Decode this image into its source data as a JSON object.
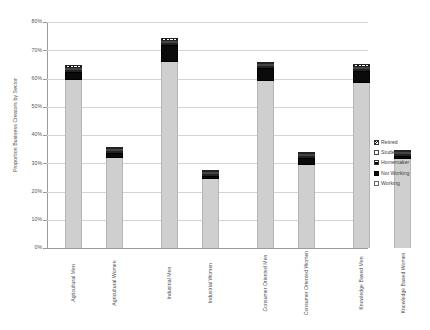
{
  "chart_data": {
    "type": "bar",
    "title": "",
    "subtitle": "",
    "xlabel": "",
    "ylabel": "Proportion Business Creators by Sector",
    "ylim": [
      0,
      80
    ],
    "ytick_labels": [
      "80%",
      "70%",
      "60%",
      "50%",
      "40%",
      "30%",
      "20%",
      "10%",
      "0%"
    ],
    "ytick_values": [
      80,
      70,
      60,
      50,
      40,
      30,
      20,
      10,
      0
    ],
    "grid": true,
    "legend_position": "right",
    "stacked": true,
    "categories": [
      "Agricultural Men",
      "Agricultural Women",
      "Industrial Men",
      "Industrial Women",
      "Consumer Oriented Men",
      "Consumer Oriented Women",
      "Knowledge Based Men",
      "Knowledge Based Women"
    ],
    "series": [
      {
        "name": "Working",
        "swatch": "white-outline",
        "values": [
          59.5,
          32.0,
          66.0,
          24.5,
          59.0,
          29.5,
          58.5,
          31.5
        ]
      },
      {
        "name": "Not Working",
        "swatch": "black-solid",
        "values": [
          2.8,
          1.6,
          6.0,
          0.9,
          4.6,
          2.2,
          4.0,
          0.9
        ]
      },
      {
        "name": "Homemaker",
        "swatch": "horizontal-hatch",
        "values": [
          0.6,
          0.7,
          0.5,
          0.3,
          0.6,
          0.7,
          0.5,
          0.5
        ]
      },
      {
        "name": "Student",
        "swatch": "white-box",
        "values": [
          0.5,
          0.6,
          0.4,
          0.3,
          0.5,
          0.6,
          0.4,
          0.4
        ]
      },
      {
        "name": "Retired",
        "swatch": "diagonal-hatch",
        "values": [
          0.9,
          0.6,
          1.1,
          0.5,
          0.8,
          0.7,
          1.1,
          0.7
        ]
      }
    ],
    "totals": [
      64.3,
      35.5,
      74.0,
      26.5,
      65.5,
      33.7,
      64.5,
      34.0
    ]
  },
  "legend": {
    "items": [
      {
        "label": "Retired"
      },
      {
        "label": "Student"
      },
      {
        "label": "Homemaker"
      },
      {
        "label": "Not Working"
      },
      {
        "label": "Working"
      }
    ]
  },
  "colors": {
    "working": "#cfcfcf",
    "not_working": "#0b0b0b",
    "grid": "#d4d4d4",
    "axis": "#9a9a9a",
    "text": "#4d4d4d"
  }
}
